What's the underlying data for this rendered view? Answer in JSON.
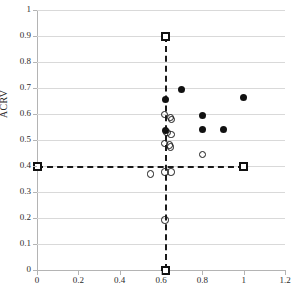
{
  "chart_data": {
    "type": "scatter",
    "title": "",
    "xlabel": "",
    "ylabel": "ACRV",
    "xlim": [
      0,
      1.2
    ],
    "ylim": [
      0,
      1
    ],
    "grid": true,
    "legend": "none",
    "xticks": [
      "0",
      "0.2",
      "0.4",
      "0.6",
      "0.8",
      "1",
      "1.2"
    ],
    "xtick_values": [
      0,
      0.2,
      0.4,
      0.6,
      0.8,
      1,
      1.2
    ],
    "yticks": [
      "0",
      "0.1",
      "0.2",
      "0.3",
      "0.4",
      "0.5",
      "0.6",
      "0.7",
      "0.8",
      "0.9",
      "1"
    ],
    "ytick_values": [
      0,
      0.1,
      0.2,
      0.3,
      0.4,
      0.5,
      0.6,
      0.7,
      0.8,
      0.9,
      1
    ],
    "series": [
      {
        "name": "filled-circles",
        "marker": "filled-circle",
        "color": "#111111",
        "points": [
          {
            "x": 0.62,
            "y": 0.655
          },
          {
            "x": 0.62,
            "y": 0.537
          },
          {
            "x": 0.7,
            "y": 0.693
          },
          {
            "x": 0.8,
            "y": 0.595
          },
          {
            "x": 0.8,
            "y": 0.541
          },
          {
            "x": 0.9,
            "y": 0.541
          },
          {
            "x": 1.0,
            "y": 0.663
          }
        ]
      },
      {
        "name": "open-circles",
        "marker": "open-circle",
        "color": "#1a1a1a",
        "points": [
          {
            "x": 0.617,
            "y": 0.598
          },
          {
            "x": 0.645,
            "y": 0.586
          },
          {
            "x": 0.652,
            "y": 0.578
          },
          {
            "x": 0.628,
            "y": 0.529
          },
          {
            "x": 0.648,
            "y": 0.522
          },
          {
            "x": 0.617,
            "y": 0.487
          },
          {
            "x": 0.64,
            "y": 0.481
          },
          {
            "x": 0.645,
            "y": 0.474
          },
          {
            "x": 0.8,
            "y": 0.445
          },
          {
            "x": 0.55,
            "y": 0.369
          },
          {
            "x": 0.62,
            "y": 0.376
          },
          {
            "x": 0.648,
            "y": 0.376
          },
          {
            "x": 0.62,
            "y": 0.193
          }
        ]
      },
      {
        "name": "reference-squares",
        "marker": "open-square",
        "color": "#111111",
        "points": [
          {
            "x": 0.62,
            "y": 0.9
          },
          {
            "x": 0.62,
            "y": 0.0
          },
          {
            "x": 0.0,
            "y": 0.4
          },
          {
            "x": 1.0,
            "y": 0.4
          }
        ]
      }
    ],
    "reference_lines": [
      {
        "name": "horizontal-threshold",
        "orientation": "horizontal",
        "value": 0.4,
        "from": 0.0,
        "to": 1.0,
        "style": "dashed"
      },
      {
        "name": "vertical-threshold",
        "orientation": "vertical",
        "value": 0.62,
        "from": 0.0,
        "to": 0.9,
        "style": "dashed"
      }
    ]
  }
}
